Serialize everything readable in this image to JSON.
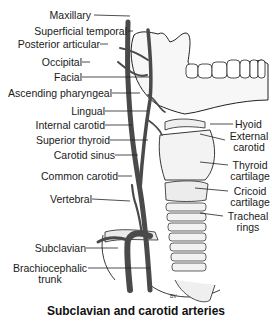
{
  "figure": {
    "caption": "Subclavian and carotid arteries",
    "left_labels": [
      {
        "id": "maxillary",
        "text": "Maxillary"
      },
      {
        "id": "superficial-temporal",
        "text": "Superficial temporal"
      },
      {
        "id": "posterior-articular",
        "text": "Posterior articular"
      },
      {
        "id": "occipital",
        "text": "Occipital"
      },
      {
        "id": "facial",
        "text": "Facial"
      },
      {
        "id": "ascending-pharyngeal",
        "text": "Ascending pharyngeal"
      },
      {
        "id": "lingual",
        "text": "Lingual"
      },
      {
        "id": "internal-carotid",
        "text": "Internal carotid"
      },
      {
        "id": "superior-thyroid",
        "text": "Superior thyroid"
      },
      {
        "id": "carotid-sinus",
        "text": "Carotid sinus"
      },
      {
        "id": "common-carotid",
        "text": "Common carotid"
      },
      {
        "id": "vertebral",
        "text": "Vertebral"
      },
      {
        "id": "subclavian",
        "text": "Subclavian"
      },
      {
        "id": "brachiocephalic-trunk",
        "text": "Brachiocephalic\ntrunk"
      }
    ],
    "right_labels": [
      {
        "id": "hyoid",
        "text": "Hyoid"
      },
      {
        "id": "external-carotid",
        "text": "External\ncarotid"
      },
      {
        "id": "thyroid-cartilage",
        "text": "Thyroid\ncartilage"
      },
      {
        "id": "cricoid-cartilage",
        "text": "Cricoid\ncartilage"
      },
      {
        "id": "tracheal-rings",
        "text": "Tracheal\nrings"
      }
    ],
    "signature": "BV"
  }
}
